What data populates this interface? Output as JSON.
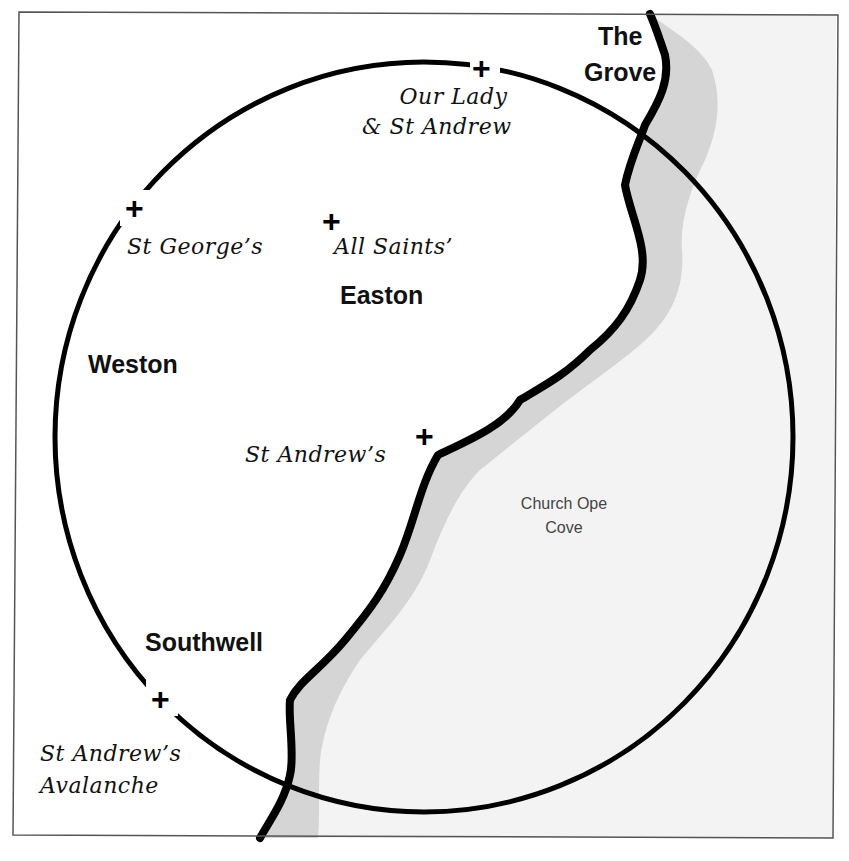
{
  "map": {
    "colors": {
      "land": "#ffffff",
      "sea": "#f3f3f3",
      "shore_stipple": "#bdbdbd",
      "coastline": "#000000",
      "circle": "#000000",
      "frame": "#555555"
    },
    "towns": [
      {
        "id": "the-grove",
        "line1": "The",
        "line2": "Grove"
      },
      {
        "id": "easton",
        "label": "Easton"
      },
      {
        "id": "weston",
        "label": "Weston"
      },
      {
        "id": "southwell",
        "label": "Southwell"
      }
    ],
    "churches": [
      {
        "id": "our-lady-st-andrew",
        "line1": "Our Lady",
        "line2": "& St Andrew",
        "icon": "cross-icon"
      },
      {
        "id": "st-georges",
        "label": "St George’s",
        "icon": "cross-icon"
      },
      {
        "id": "all-saints",
        "label": "All Saints’",
        "icon": "cross-icon"
      },
      {
        "id": "st-andrews",
        "label": "St Andrew’s",
        "icon": "cross-icon"
      },
      {
        "id": "st-andrews-avalanche",
        "line1": "St Andrew’s",
        "line2": "Avalanche",
        "icon": "cross-icon"
      }
    ],
    "sea_labels": [
      {
        "id": "church-ope-cove",
        "line1": "Church Ope",
        "line2": "Cove"
      }
    ],
    "cross_glyph": "+"
  }
}
